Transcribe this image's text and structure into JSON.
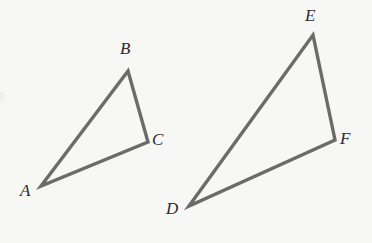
{
  "figure": {
    "kind": "geometry-diagram",
    "background_color": "#f7f7f5",
    "stroke_color": "#6b6b6b",
    "label_color": "#2b2b2b",
    "stroke_width": 3.4,
    "width": 372,
    "height": 243
  },
  "shapes": [
    {
      "name": "triangle-abc",
      "points": "41,186 128,71 148,142",
      "vertices": [
        {
          "id": "A",
          "x": 41,
          "y": 186
        },
        {
          "id": "B",
          "x": 128,
          "y": 71
        },
        {
          "id": "C",
          "x": 148,
          "y": 142
        }
      ]
    },
    {
      "name": "triangle-def",
      "points": "189,206 313,35 335,140",
      "vertices": [
        {
          "id": "D",
          "x": 189,
          "y": 206
        },
        {
          "id": "E",
          "x": 313,
          "y": 35
        },
        {
          "id": "F",
          "x": 335,
          "y": 140
        }
      ]
    }
  ],
  "labels": {
    "a": "A",
    "b": "B",
    "c": "C",
    "d": "D",
    "e": "E",
    "f": "F"
  }
}
